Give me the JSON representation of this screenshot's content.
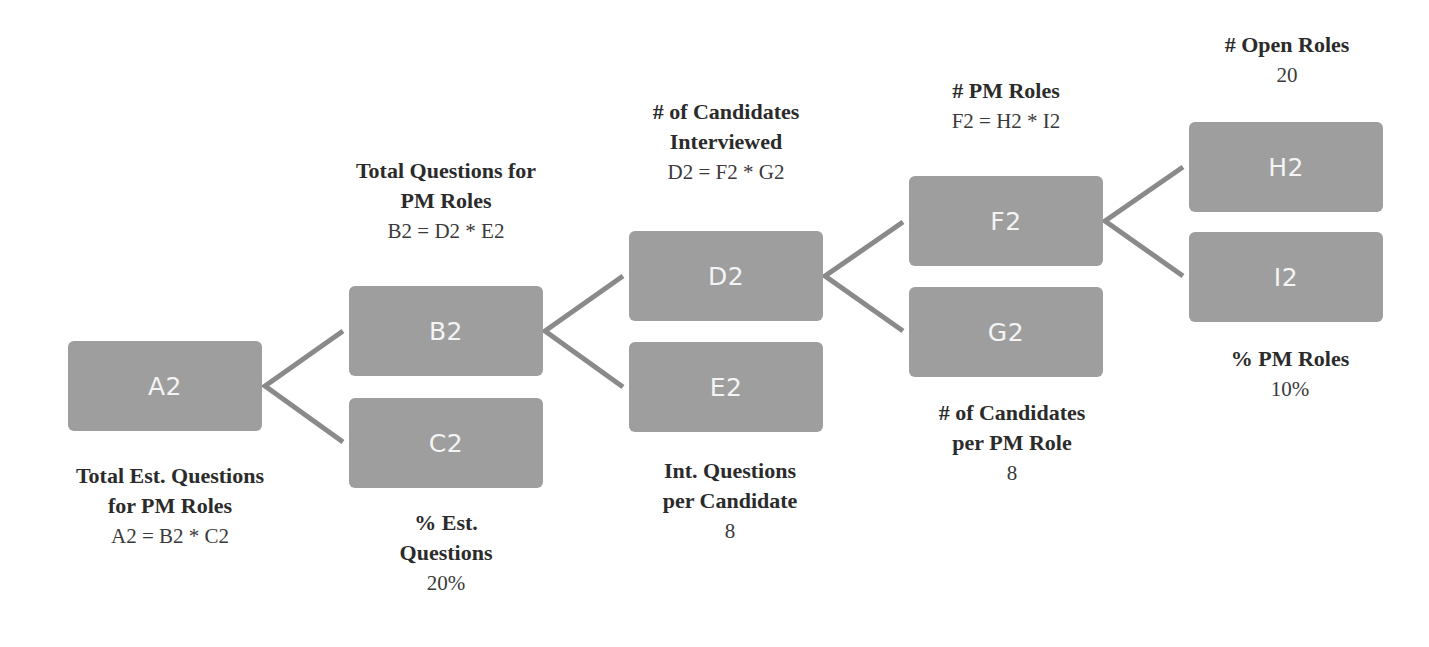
{
  "diagram": {
    "type": "driver-tree",
    "colors": {
      "node_fill": "#9e9e9e",
      "node_text": "#f4f4f4",
      "connector": "#8a8a8a",
      "label_text": "#2b2b2b"
    },
    "nodes": {
      "a2": {
        "id": "A2",
        "title_line1": "Total Est. Questions",
        "title_line2": "for PM Roles",
        "value": "A2 = B2 * C2"
      },
      "b2": {
        "id": "B2",
        "title_line1": "Total Questions for",
        "title_line2": "PM Roles",
        "value": "B2 = D2 * E2"
      },
      "c2": {
        "id": "C2",
        "title_line1": "% Est.",
        "title_line2": "Questions",
        "value": "20%"
      },
      "d2": {
        "id": "D2",
        "title_line1": "# of Candidates",
        "title_line2": "Interviewed",
        "value": "D2 = F2 * G2"
      },
      "e2": {
        "id": "E2",
        "title_line1": "Int. Questions",
        "title_line2": "per Candidate",
        "value": "8"
      },
      "f2": {
        "id": "F2",
        "title_line1": "# PM Roles",
        "value": "F2 = H2 * I2"
      },
      "g2": {
        "id": "G2",
        "title_line1": "# of Candidates",
        "title_line2": "per PM Role",
        "value": "8"
      },
      "h2": {
        "id": "H2",
        "title_line1": "# Open Roles",
        "value": "20"
      },
      "i2": {
        "id": "I2",
        "title_line1": "% PM Roles",
        "value": "10%"
      }
    },
    "edges": [
      {
        "from": "A2",
        "to": "B2"
      },
      {
        "from": "A2",
        "to": "C2"
      },
      {
        "from": "B2",
        "to": "D2"
      },
      {
        "from": "B2",
        "to": "E2"
      },
      {
        "from": "D2",
        "to": "F2"
      },
      {
        "from": "D2",
        "to": "G2"
      },
      {
        "from": "F2",
        "to": "H2"
      },
      {
        "from": "F2",
        "to": "I2"
      }
    ]
  }
}
